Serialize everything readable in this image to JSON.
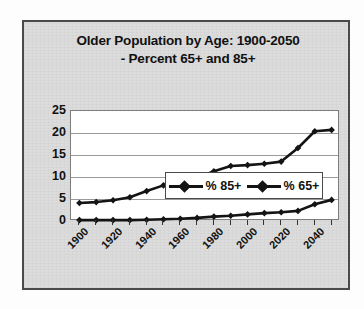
{
  "frame": {
    "background_color": "#dcdcdc",
    "border_color": "#4a4a4a"
  },
  "title": {
    "line1": "Older Population by Age: 1900-2050",
    "line2": "- Percent 65+ and 85+"
  },
  "legend": {
    "position": "inside-plot-middle-right",
    "items": [
      {
        "label": "% 85+",
        "marker": "diamond",
        "color": "#141414"
      },
      {
        "label": "% 65+",
        "marker": "diamond",
        "color": "#141414"
      }
    ]
  },
  "chart_data": {
    "type": "line",
    "title": "Older Population by Age: 1900-2050 - Percent 65+ and 85+",
    "xlabel": "",
    "ylabel": "",
    "x": [
      1900,
      1910,
      1920,
      1930,
      1940,
      1950,
      1960,
      1970,
      1980,
      1990,
      2000,
      2010,
      2020,
      2030,
      2040,
      2050
    ],
    "tick_labels": [
      "1900",
      "1910",
      "1920",
      "1930",
      "1940",
      "1950",
      "1960",
      "1970",
      "1980",
      "1990",
      "2000",
      "2010",
      "2020",
      "2030",
      "2040",
      "2050"
    ],
    "visible_tick_labels": [
      "1900",
      "1920",
      "1940",
      "1960",
      "1980",
      "2000",
      "2020",
      "2040"
    ],
    "ylim": [
      0,
      25
    ],
    "yticks": [
      0,
      5,
      10,
      15,
      20,
      25
    ],
    "ytick_labels": [
      "0",
      "5",
      "10",
      "15",
      "20",
      "25"
    ],
    "grid": "horizontal",
    "series": [
      {
        "name": "% 65+",
        "color": "#141414",
        "marker": "diamond",
        "values": [
          4.1,
          4.3,
          4.7,
          5.4,
          6.8,
          8.1,
          9.2,
          9.8,
          11.3,
          12.5,
          12.7,
          13.0,
          13.5,
          16.6,
          20.4,
          20.7
        ]
      },
      {
        "name": "% 85+",
        "color": "#141414",
        "marker": "diamond",
        "values": [
          0.2,
          0.2,
          0.2,
          0.2,
          0.3,
          0.4,
          0.5,
          0.7,
          1.0,
          1.2,
          1.5,
          1.8,
          2.0,
          2.3,
          3.8,
          4.8
        ]
      }
    ]
  }
}
